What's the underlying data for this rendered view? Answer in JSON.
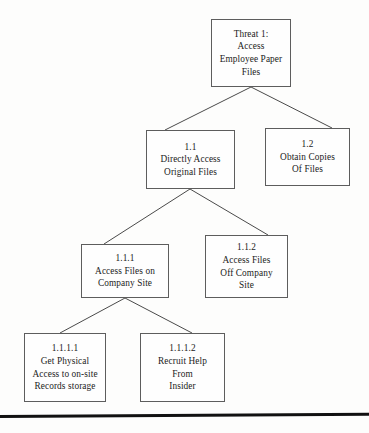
{
  "diagram": {
    "type": "attack-tree",
    "title_node": "threat-1",
    "style": {
      "box_border_color": "#5d5d5d",
      "connector_color": "#4a4a4a",
      "text_color": "#1b1b1b",
      "background_color": "#fdfdfc",
      "rule_color": "#111111"
    },
    "nodes": [
      {
        "id": "threat-1",
        "lines": [
          "Threat 1:",
          "Access",
          "Employee Paper",
          "Files"
        ],
        "x": 211,
        "y": 19,
        "w": 80,
        "h": 68
      },
      {
        "id": "node-1-1",
        "lines": [
          "1.1",
          "Directly Access",
          "Original Files"
        ],
        "x": 146,
        "y": 130,
        "w": 89,
        "h": 59
      },
      {
        "id": "node-1-2",
        "lines": [
          "1.2",
          "Obtain Copies",
          "Of Files"
        ],
        "x": 265,
        "y": 128,
        "w": 85,
        "h": 58
      },
      {
        "id": "node-1-1-1",
        "lines": [
          "1.1.1",
          "Access Files on",
          "Company Site"
        ],
        "x": 81,
        "y": 244,
        "w": 88,
        "h": 54
      },
      {
        "id": "node-1-1-2",
        "lines": [
          "1.1.2",
          "Access Files",
          "Off Company",
          "Site"
        ],
        "x": 205,
        "y": 235,
        "w": 83,
        "h": 63
      },
      {
        "id": "node-1-1-1-1",
        "lines": [
          "1.1.1.1",
          "Get Physical",
          "Access to on-site",
          "Records storage"
        ],
        "x": 24,
        "y": 333,
        "w": 82,
        "h": 69
      },
      {
        "id": "node-1-1-1-2",
        "lines": [
          "1.1.1.2",
          "Recruit Help",
          "From",
          "Insider"
        ],
        "x": 140,
        "y": 333,
        "w": 85,
        "h": 69
      }
    ],
    "edges": [
      {
        "id": "edge-threat1-to-1-1",
        "from": "threat-1",
        "to": "node-1-1",
        "x1": 251,
        "y1": 87,
        "x2": 165,
        "y2": 130
      },
      {
        "id": "edge-threat1-to-1-2",
        "from": "threat-1",
        "to": "node-1-2",
        "x1": 251,
        "y1": 87,
        "x2": 332,
        "y2": 128
      },
      {
        "id": "edge-1-1-to-1-1-1",
        "from": "node-1-1",
        "to": "node-1-1-1",
        "x1": 190,
        "y1": 189,
        "x2": 104,
        "y2": 244
      },
      {
        "id": "edge-1-1-to-1-1-2",
        "from": "node-1-1",
        "to": "node-1-1-2",
        "x1": 190,
        "y1": 189,
        "x2": 268,
        "y2": 235
      },
      {
        "id": "edge-1-1-1-to-1-1-1-1",
        "from": "node-1-1-1",
        "to": "node-1-1-1-1",
        "x1": 125,
        "y1": 298,
        "x2": 60,
        "y2": 333
      },
      {
        "id": "edge-1-1-1-to-1-1-1-2",
        "from": "node-1-1-1",
        "to": "node-1-1-1-2",
        "x1": 125,
        "y1": 298,
        "x2": 192,
        "y2": 333
      }
    ],
    "bottom_rule": {
      "id": "bottom-rule",
      "x": 0,
      "y": 415,
      "w": 369,
      "h": 3
    }
  }
}
